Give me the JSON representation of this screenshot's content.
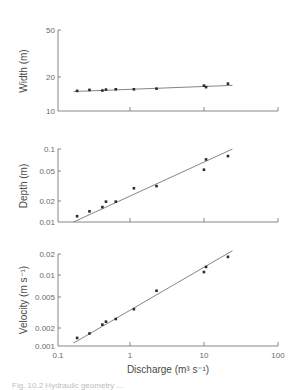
{
  "chart_data": [
    {
      "type": "scatter",
      "title": "",
      "xlabel": "Discharge (m³ s⁻¹)",
      "ylabel": "Width (m)",
      "xscale": "log",
      "yscale": "log",
      "xlim": [
        0.1,
        100
      ],
      "ylim": [
        10,
        50
      ],
      "yticks": [
        "10",
        "20",
        "50"
      ],
      "x": [
        0.19,
        0.28,
        0.42,
        0.47,
        0.64,
        1.13,
        2.3,
        10.2,
        10.9,
        21.7
      ],
      "y": [
        15.1,
        15.4,
        15.2,
        15.5,
        15.6,
        15.6,
        15.8,
        16.8,
        16.3,
        17.5
      ],
      "fit_line": {
        "x": [
          0.17,
          25
        ],
        "y": [
          14.9,
          16.9
        ]
      }
    },
    {
      "type": "scatter",
      "title": "",
      "xlabel": "Discharge (m³ s⁻¹)",
      "ylabel": "Depth (m)",
      "xscale": "log",
      "yscale": "log",
      "xlim": [
        0.1,
        100
      ],
      "ylim": [
        0.01,
        0.1
      ],
      "yticks": [
        "0.01",
        "0.02",
        "0.05",
        "0.1"
      ],
      "x": [
        0.19,
        0.28,
        0.42,
        0.47,
        0.64,
        1.13,
        2.3,
        10.2,
        10.9,
        21.7
      ],
      "y": [
        0.012,
        0.014,
        0.016,
        0.019,
        0.019,
        0.029,
        0.031,
        0.052,
        0.072,
        0.08
      ],
      "fit_line": {
        "x": [
          0.17,
          25
        ],
        "y": [
          0.01,
          0.1
        ]
      }
    },
    {
      "type": "scatter",
      "title": "",
      "xlabel": "Discharge (m³ s⁻¹)",
      "ylabel": "Velocity (m s⁻¹)",
      "xscale": "log",
      "yscale": "log",
      "xlim": [
        0.1,
        100
      ],
      "ylim": [
        0.001,
        0.02
      ],
      "yticks": [
        "0.001",
        "0.002",
        "0.005",
        "0.01",
        "0.02"
      ],
      "xticks": [
        "0.1",
        "1",
        "10",
        "100"
      ],
      "x": [
        0.19,
        0.28,
        0.42,
        0.47,
        0.64,
        1.13,
        2.3,
        10.2,
        10.9,
        21.7
      ],
      "y": [
        0.0013,
        0.0015,
        0.002,
        0.0022,
        0.0024,
        0.0033,
        0.006,
        0.011,
        0.013,
        0.018
      ],
      "fit_line": {
        "x": [
          0.17,
          25
        ],
        "y": [
          0.0011,
          0.022
        ]
      }
    }
  ],
  "labels": {
    "width_ylabel": "Width (m)",
    "depth_ylabel": "Depth (m)",
    "velocity_ylabel": "Velocity (m s⁻¹)",
    "xlabel": "Discharge (m³ s⁻¹)",
    "x_ticks": [
      "0.1",
      "1",
      "10",
      "100"
    ],
    "width_ticks": [
      "50",
      "20",
      "10"
    ],
    "depth_ticks": [
      "0.1",
      "0.05",
      "0.02",
      "0.01"
    ],
    "velocity_ticks": [
      "0.02",
      "0.01",
      "0.005",
      "0.002",
      "0.001"
    ]
  },
  "caption": "Fig. 10.2  Hydraulic geometry ..."
}
